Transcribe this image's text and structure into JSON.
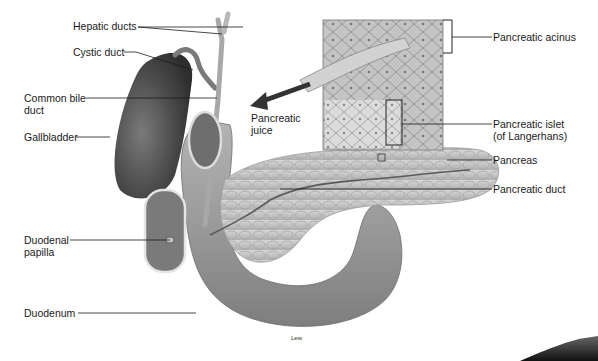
{
  "diagram": {
    "credit": "Lew",
    "labels": {
      "hepatic_ducts": "Hepatic ducts",
      "cystic_duct": "Cystic duct",
      "common_bile_duct_line1": "Common bile",
      "common_bile_duct_line2": "duct",
      "gallbladder": "Gallbladder",
      "pancreatic_juice_line1": "Pancreatic",
      "pancreatic_juice_line2": "juice",
      "pancreatic_acinus": "Pancreatic acinus",
      "pancreatic_islet_line1": "Pancreatic islet",
      "pancreatic_islet_line2": "(of Langerhans)",
      "pancreas": "Pancreas",
      "pancreatic_duct": "Pancreatic duct",
      "duodenal_papilla_line1": "Duodenal",
      "duodenal_papilla_line2": "papilla",
      "duodenum": "Duodenum"
    },
    "colors": {
      "background": "#ffffff",
      "organ_dark": "#4a4a4a",
      "organ_mid": "#8c8c8c",
      "organ_light": "#c8c8c8",
      "leader_line": "#1a1a1a",
      "text": "#1a1a1a"
    }
  }
}
